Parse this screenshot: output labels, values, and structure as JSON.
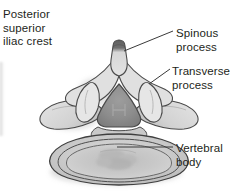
{
  "figure": {
    "background_color": "#ffffff",
    "width": 239,
    "height": 191
  },
  "labels": {
    "posterior_superior_iliac_crest": "Posterior\nsuperior\niliac crest",
    "spinous_process": "Spinous\nprocess",
    "transverse_process": "Transverse\nprocess",
    "vertebral_body": "Vertebral\nbody"
  },
  "colors": {
    "text": "#231f20",
    "leader_line": "#3a3a3a",
    "outline": "#4a4a4a",
    "bone_light": "#e9e9e9",
    "bone_mid": "#cfcfcf",
    "bone_shade": "#b2b2b2",
    "foramen_dark": "#8a8a8a",
    "spinous_tip": "#5f5f5f",
    "shadow": "#c8c8c8"
  },
  "structures": [
    {
      "name": "spinous-process",
      "description": "Midline posterior projection with dark shaded tip"
    },
    {
      "name": "transverse-process-left",
      "description": "Left lateral wing projection"
    },
    {
      "name": "transverse-process-right",
      "description": "Right lateral wing projection"
    },
    {
      "name": "vertebral-foramen",
      "description": "Central triangular dark opening"
    },
    {
      "name": "superior-articular-process-left",
      "description": "Left upward facing articular process"
    },
    {
      "name": "superior-articular-process-right",
      "description": "Right upward facing articular process"
    },
    {
      "name": "vertebral-body",
      "description": "Large rounded anterior oval mass with concentric contours"
    },
    {
      "name": "iliac-crest-edge",
      "description": "Faint cropped structure at left margin"
    }
  ],
  "leader_lines": [
    {
      "name": "leader-spinous",
      "from": "Spinous process label",
      "to": "spinous process tip"
    },
    {
      "name": "leader-transverse",
      "from": "Transverse process label",
      "to": "right transverse process tip"
    },
    {
      "name": "leader-vertebral",
      "from": "Vertebral body label",
      "to": "center of vertebral body"
    }
  ]
}
